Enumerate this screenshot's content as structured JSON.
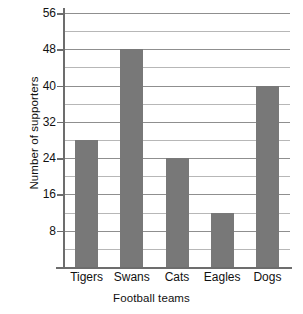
{
  "chart_data": {
    "type": "bar",
    "title": "",
    "xlabel": "Football teams",
    "ylabel": "Number of supporters",
    "categories": [
      "Tigers",
      "Swans",
      "Cats",
      "Eagles",
      "Dogs"
    ],
    "values": [
      28,
      48,
      24,
      12,
      40
    ],
    "series": [
      {
        "name": "Number of supporters",
        "values": [
          28,
          48,
          24,
          12,
          40
        ]
      }
    ],
    "ylim": [
      0,
      56
    ],
    "ytick_labels": [
      "8",
      "16",
      "24",
      "32",
      "40",
      "48",
      "56"
    ],
    "ytick_values": [
      8,
      16,
      24,
      32,
      40,
      48,
      56
    ],
    "gridline_values": [
      4,
      8,
      12,
      16,
      20,
      24,
      28,
      32,
      36,
      40,
      44,
      48,
      52,
      56
    ],
    "grid": true,
    "legend": "none",
    "bar_color": "#787878",
    "grid_color": "#b7b7b7",
    "axis_color": "#6d6d6d",
    "background_color": "#ffffff"
  }
}
